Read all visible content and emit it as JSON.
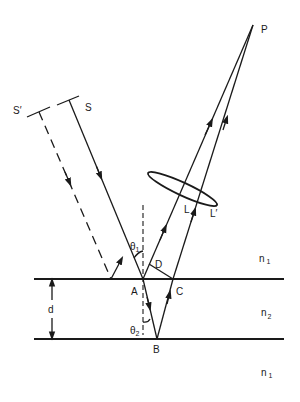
{
  "figure": {
    "labels": {
      "source": "S",
      "source_prime": "S′",
      "point": "P",
      "lens_ray_1": "L",
      "lens_ray_2": "L′",
      "point_A": "A",
      "point_B": "B",
      "point_C": "C",
      "point_D": "D",
      "thickness": "d",
      "theta": "θ",
      "theta1_sub": "1",
      "theta2_sub": "2",
      "n": "n",
      "n1_sub": "1",
      "n2_sub": "2"
    },
    "media": [
      {
        "region": "above film",
        "index": "n1"
      },
      {
        "region": "film",
        "index": "n2"
      },
      {
        "region": "below film",
        "index": "n1"
      }
    ],
    "stroke_color": "#1a1a1a",
    "background": "#ffffff"
  }
}
